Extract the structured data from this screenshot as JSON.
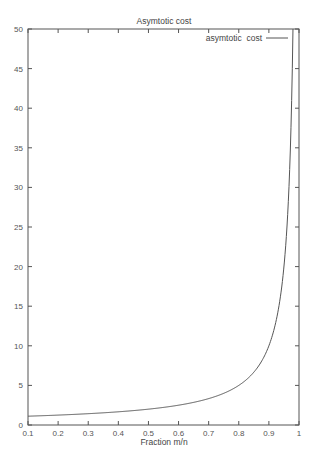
{
  "chart_data": {
    "type": "line",
    "title": "Asymtotic cost",
    "xlabel": "Fraction m/n",
    "ylabel": "",
    "xlim": [
      0.1,
      1
    ],
    "ylim": [
      0,
      50
    ],
    "x_ticks": [
      "0.1",
      "0.2",
      "0.3",
      "0.4",
      "0.5",
      "0.6",
      "0.7",
      "0.8",
      "0.9",
      "1"
    ],
    "y_ticks": [
      "0",
      "5",
      "10",
      "15",
      "20",
      "25",
      "30",
      "35",
      "40",
      "45",
      "50"
    ],
    "grid": false,
    "legend_position": "top-right",
    "series": [
      {
        "name": "asymtotic  cost",
        "color": "#555555",
        "function": "1/(1-x)",
        "x": [
          0.1,
          0.2,
          0.3,
          0.4,
          0.5,
          0.6,
          0.7,
          0.8,
          0.85,
          0.9,
          0.92,
          0.94,
          0.95,
          0.96,
          0.97,
          0.975,
          0.98
        ],
        "y": [
          1.11,
          1.25,
          1.43,
          1.67,
          2.0,
          2.5,
          3.33,
          5.0,
          6.67,
          10.0,
          12.5,
          16.67,
          20.0,
          25.0,
          33.33,
          40.0,
          50.0
        ]
      }
    ]
  }
}
